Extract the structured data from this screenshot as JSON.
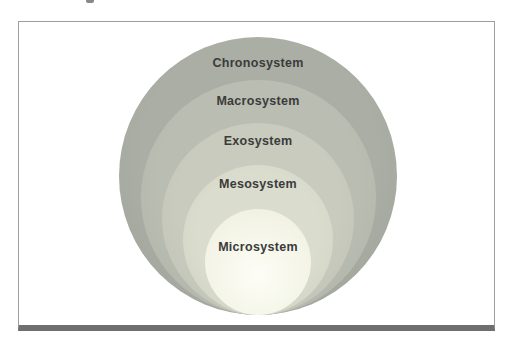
{
  "figure": {
    "type": "nested-circles-diagram",
    "background": "#ffffff",
    "frame": {
      "border_color": "#9e9e9e",
      "bottom_bar_color": "#6f6f6f"
    },
    "label_color": "#3b3b3b",
    "stray_mark_color": "#6a6a6a",
    "layers": [
      {
        "label": "Chronosystem",
        "fill": "#a8aba1"
      },
      {
        "label": "Macrosystem",
        "fill": "#b7bab0"
      },
      {
        "label": "Exosystem",
        "fill": "#c6c9bd"
      },
      {
        "label": "Mesosystem",
        "fill": "#d7d9cb"
      },
      {
        "label": "Microsystem",
        "fill": "#f3f4e7"
      }
    ]
  }
}
